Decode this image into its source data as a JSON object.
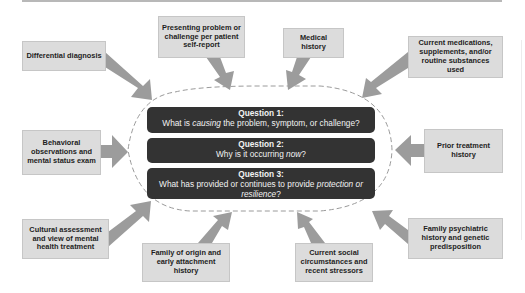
{
  "diagram": {
    "type": "flow-into-center",
    "colors": {
      "box_fill": "#dcdcdc",
      "box_border": "#c6c6c6",
      "arrow": "#9c9c9c",
      "question_fill": "#333333",
      "question_text": "#f2f2f2",
      "dashed_outline": "#9a9a9a"
    },
    "inputs": {
      "differential_diagnosis": "Differential diagnosis",
      "presenting_problem": "Presenting problem or challenge per patient self-report",
      "medical_history": "Medical history",
      "current_medications": "Current medications, supplements, and/or routine substances used",
      "behavioral_observations": "Behavioral observations and mental status exam",
      "prior_treatment": "Prior treatment history",
      "cultural_assessment": "Cultural assessment and view of mental health treatment",
      "family_of_origin": "Family of origin and early attachment history",
      "current_social": "Current social circumstances and recent stressors",
      "family_psychiatric": "Family psychiatric history and genetic predisposition"
    },
    "questions": [
      {
        "title": "Question 1:",
        "pre": "What is ",
        "em": "causing",
        "post": " the problem, symptom, or challenge?"
      },
      {
        "title": "Question 2:",
        "pre": "Why is it occurring ",
        "em": "now",
        "post": "?"
      },
      {
        "title": "Question 3:",
        "pre": "What has provided or continues to provide ",
        "em": "protection or resilience",
        "post": "?"
      }
    ]
  }
}
